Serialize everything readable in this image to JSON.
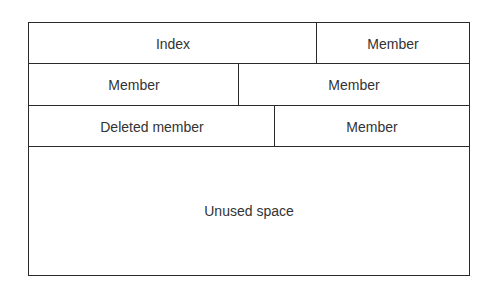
{
  "diagram": {
    "rows": [
      {
        "cells": [
          {
            "label": "Index"
          },
          {
            "label": "Member"
          }
        ]
      },
      {
        "cells": [
          {
            "label": "Member"
          },
          {
            "label": "Member"
          }
        ]
      },
      {
        "cells": [
          {
            "label": "Deleted member"
          },
          {
            "label": "Member"
          }
        ]
      },
      {
        "cells": [
          {
            "label": "Unused space"
          }
        ]
      }
    ]
  }
}
